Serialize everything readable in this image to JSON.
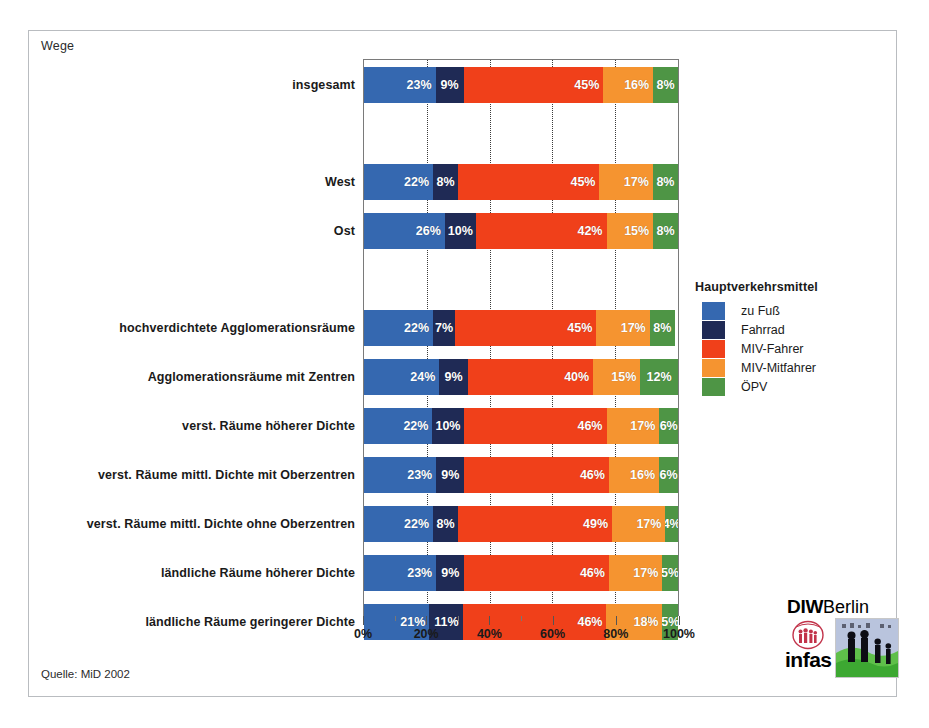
{
  "caption": "Wege",
  "source_note": "Quelle: MiD 2002",
  "legend": {
    "title": "Hauptverkehrsmittel",
    "items": [
      {
        "label": "zu Fuß",
        "color": "#3568b0"
      },
      {
        "label": "Fahrrad",
        "color": "#1f2a55"
      },
      {
        "label": "MIV-Fahrer",
        "color": "#f0401a"
      },
      {
        "label": "MIV-Mitfahrer",
        "color": "#f59430"
      },
      {
        "label": "ÖPV",
        "color": "#4e9545"
      }
    ]
  },
  "axis": {
    "min": 0,
    "max": 100,
    "major_ticks": [
      0,
      20,
      40,
      60,
      80,
      100
    ],
    "major_tick_labels": [
      "0%",
      "20%",
      "40%",
      "60%",
      "80%",
      "100%"
    ],
    "minor_ticks": [
      10,
      30,
      50,
      70,
      90
    ],
    "gridlines": [
      20,
      40,
      60,
      80
    ]
  },
  "logo": {
    "diw": "DIW",
    "berlin": "Berlin",
    "infas": "infas"
  },
  "chart_data": {
    "type": "bar",
    "orientation": "horizontal",
    "stacked": true,
    "title": "Wege",
    "xlabel": "",
    "ylabel": "",
    "xlim": [
      0,
      100
    ],
    "unit": "%",
    "grid": true,
    "legend_position": "right",
    "series": [
      {
        "name": "zu Fuß",
        "color": "#3568b0",
        "values": [
          23,
          22,
          26,
          22,
          24,
          22,
          23,
          22,
          23,
          21
        ]
      },
      {
        "name": "Fahrrad",
        "color": "#1f2a55",
        "values": [
          9,
          8,
          10,
          7,
          9,
          10,
          9,
          8,
          9,
          11
        ]
      },
      {
        "name": "MIV-Fahrer",
        "color": "#f0401a",
        "values": [
          45,
          45,
          42,
          45,
          40,
          46,
          46,
          49,
          46,
          46
        ]
      },
      {
        "name": "MIV-Mitfahrer",
        "color": "#f59430",
        "values": [
          16,
          17,
          15,
          17,
          15,
          17,
          16,
          17,
          17,
          18
        ]
      },
      {
        "name": "ÖPV",
        "color": "#4e9545",
        "values": [
          8,
          8,
          8,
          8,
          12,
          6,
          6,
          4,
          5,
          5
        ]
      }
    ],
    "categories": [
      "insgesamt",
      "West",
      "Ost",
      "hochverdichtete Agglomerationsräume",
      "Agglomerationsräume mit  Zentren",
      "verst. Räume höherer Dichte",
      "verst. Räume mittl. Dichte mit Oberzentren",
      "verst. Räume mittl. Dichte ohne Oberzentren",
      "ländliche Räume höherer Dichte",
      "ländliche Räume geringerer Dichte"
    ],
    "rows": [
      {
        "label": "insgesamt",
        "top": 8,
        "height": 36,
        "segments": [
          {
            "series": "zu Fuß",
            "value": 23,
            "text": "23%",
            "color": "#3568b0"
          },
          {
            "series": "Fahrrad",
            "value": 9,
            "text": "9%",
            "color": "#1f2a55"
          },
          {
            "series": "MIV-Fahrer",
            "value": 45,
            "text": "45%",
            "color": "#f0401a"
          },
          {
            "series": "MIV-Mitfahrer",
            "value": 16,
            "text": "16%",
            "color": "#f59430"
          },
          {
            "series": "ÖPV",
            "value": 8,
            "text": "8%",
            "color": "#4e9545"
          }
        ]
      },
      {
        "label": "West",
        "top": 105,
        "height": 36,
        "segments": [
          {
            "series": "zu Fuß",
            "value": 22,
            "text": "22%",
            "color": "#3568b0"
          },
          {
            "series": "Fahrrad",
            "value": 8,
            "text": "8%",
            "color": "#1f2a55"
          },
          {
            "series": "MIV-Fahrer",
            "value": 45,
            "text": "45%",
            "color": "#f0401a"
          },
          {
            "series": "MIV-Mitfahrer",
            "value": 17,
            "text": "17%",
            "color": "#f59430"
          },
          {
            "series": "ÖPV",
            "value": 8,
            "text": "8%",
            "color": "#4e9545"
          }
        ]
      },
      {
        "label": "Ost",
        "top": 154,
        "height": 36,
        "segments": [
          {
            "series": "zu Fuß",
            "value": 26,
            "text": "26%",
            "color": "#3568b0"
          },
          {
            "series": "Fahrrad",
            "value": 10,
            "text": "10%",
            "color": "#1f2a55"
          },
          {
            "series": "MIV-Fahrer",
            "value": 42,
            "text": "42%",
            "color": "#f0401a"
          },
          {
            "series": "MIV-Mitfahrer",
            "value": 15,
            "text": "15%",
            "color": "#f59430"
          },
          {
            "series": "ÖPV",
            "value": 8,
            "text": "8%",
            "color": "#4e9545"
          }
        ]
      },
      {
        "label": "hochverdichtete Agglomerationsräume",
        "top": 251,
        "height": 36,
        "segments": [
          {
            "series": "zu Fuß",
            "value": 22,
            "text": "22%",
            "color": "#3568b0"
          },
          {
            "series": "Fahrrad",
            "value": 7,
            "text": "7%",
            "color": "#1f2a55"
          },
          {
            "series": "MIV-Fahrer",
            "value": 45,
            "text": "45%",
            "color": "#f0401a"
          },
          {
            "series": "MIV-Mitfahrer",
            "value": 17,
            "text": "17%",
            "color": "#f59430"
          },
          {
            "series": "ÖPV",
            "value": 8,
            "text": "8%",
            "color": "#4e9545"
          }
        ]
      },
      {
        "label": "Agglomerationsräume mit  Zentren",
        "top": 300,
        "height": 36,
        "segments": [
          {
            "series": "zu Fuß",
            "value": 24,
            "text": "24%",
            "color": "#3568b0"
          },
          {
            "series": "Fahrrad",
            "value": 9,
            "text": "9%",
            "color": "#1f2a55"
          },
          {
            "series": "MIV-Fahrer",
            "value": 40,
            "text": "40%",
            "color": "#f0401a"
          },
          {
            "series": "MIV-Mitfahrer",
            "value": 15,
            "text": "15%",
            "color": "#f59430"
          },
          {
            "series": "ÖPV",
            "value": 12,
            "text": "12%",
            "color": "#4e9545"
          }
        ]
      },
      {
        "label": "verst. Räume höherer Dichte",
        "top": 349,
        "height": 36,
        "segments": [
          {
            "series": "zu Fuß",
            "value": 22,
            "text": "22%",
            "color": "#3568b0"
          },
          {
            "series": "Fahrrad",
            "value": 10,
            "text": "10%",
            "color": "#1f2a55"
          },
          {
            "series": "MIV-Fahrer",
            "value": 46,
            "text": "46%",
            "color": "#f0401a"
          },
          {
            "series": "MIV-Mitfahrer",
            "value": 17,
            "text": "17%",
            "color": "#f59430"
          },
          {
            "series": "ÖPV",
            "value": 6,
            "text": "6%",
            "color": "#4e9545"
          }
        ]
      },
      {
        "label": "verst. Räume mittl. Dichte mit Oberzentren",
        "top": 398,
        "height": 36,
        "segments": [
          {
            "series": "zu Fuß",
            "value": 23,
            "text": "23%",
            "color": "#3568b0"
          },
          {
            "series": "Fahrrad",
            "value": 9,
            "text": "9%",
            "color": "#1f2a55"
          },
          {
            "series": "MIV-Fahrer",
            "value": 46,
            "text": "46%",
            "color": "#f0401a"
          },
          {
            "series": "MIV-Mitfahrer",
            "value": 16,
            "text": "16%",
            "color": "#f59430"
          },
          {
            "series": "ÖPV",
            "value": 6,
            "text": "6%",
            "color": "#4e9545"
          }
        ]
      },
      {
        "label": "verst. Räume mittl. Dichte ohne Oberzentren",
        "top": 447,
        "height": 36,
        "segments": [
          {
            "series": "zu Fuß",
            "value": 22,
            "text": "22%",
            "color": "#3568b0"
          },
          {
            "series": "Fahrrad",
            "value": 8,
            "text": "8%",
            "color": "#1f2a55"
          },
          {
            "series": "MIV-Fahrer",
            "value": 49,
            "text": "49%",
            "color": "#f0401a"
          },
          {
            "series": "MIV-Mitfahrer",
            "value": 17,
            "text": "17%",
            "color": "#f59430"
          },
          {
            "series": "ÖPV",
            "value": 4,
            "text": "4%",
            "color": "#4e9545"
          }
        ]
      },
      {
        "label": "ländliche Räume höherer Dichte",
        "top": 496,
        "height": 36,
        "segments": [
          {
            "series": "zu Fuß",
            "value": 23,
            "text": "23%",
            "color": "#3568b0"
          },
          {
            "series": "Fahrrad",
            "value": 9,
            "text": "9%",
            "color": "#1f2a55"
          },
          {
            "series": "MIV-Fahrer",
            "value": 46,
            "text": "46%",
            "color": "#f0401a"
          },
          {
            "series": "MIV-Mitfahrer",
            "value": 17,
            "text": "17%",
            "color": "#f59430"
          },
          {
            "series": "ÖPV",
            "value": 5,
            "text": "5%",
            "color": "#4e9545"
          }
        ]
      },
      {
        "label": "ländliche Räume geringerer Dichte",
        "top": 545,
        "height": 36,
        "segments": [
          {
            "series": "zu Fuß",
            "value": 21,
            "text": "21%",
            "color": "#3568b0"
          },
          {
            "series": "Fahrrad",
            "value": 11,
            "text": "11%",
            "color": "#1f2a55"
          },
          {
            "series": "MIV-Fahrer",
            "value": 46,
            "text": "46%",
            "color": "#f0401a"
          },
          {
            "series": "MIV-Mitfahrer",
            "value": 18,
            "text": "18%",
            "color": "#f59430"
          },
          {
            "series": "ÖPV",
            "value": 5,
            "text": "5%",
            "color": "#4e9545"
          }
        ]
      }
    ]
  }
}
